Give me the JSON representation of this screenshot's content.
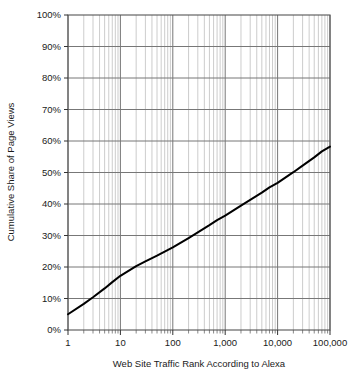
{
  "chart_data": {
    "type": "line",
    "title": "",
    "xlabel": "Web Site Traffic Rank According to Alexa",
    "ylabel": "Cumulative Share of Page Views",
    "xscale": "log",
    "yscale": "linear",
    "xlim": [
      1,
      100000
    ],
    "ylim": [
      0,
      100
    ],
    "grid": true,
    "grid_minor_x": true,
    "legend": "none",
    "x_tick_labels": [
      "1",
      "10",
      "100",
      "1,000",
      "10,000",
      "100,000"
    ],
    "x_tick_values": [
      1,
      10,
      100,
      1000,
      10000,
      100000
    ],
    "y_tick_labels": [
      "0%",
      "10%",
      "20%",
      "30%",
      "40%",
      "50%",
      "60%",
      "70%",
      "80%",
      "90%",
      "100%"
    ],
    "y_tick_values": [
      0,
      10,
      20,
      30,
      40,
      50,
      60,
      70,
      80,
      90,
      100
    ],
    "series": [
      {
        "name": "Cumulative share of page views",
        "color": "#000000",
        "x": [
          1,
          2,
          3,
          5,
          7,
          10,
          20,
          30,
          50,
          70,
          100,
          200,
          300,
          500,
          700,
          1000,
          2000,
          3000,
          5000,
          7000,
          10000,
          20000,
          30000,
          50000,
          70000,
          100000
        ],
        "values": [
          5.0,
          8.3,
          10.4,
          13.2,
          15.2,
          17.2,
          20.3,
          21.8,
          23.6,
          24.9,
          26.2,
          29.2,
          31.0,
          33.3,
          34.9,
          36.3,
          39.5,
          41.3,
          43.6,
          45.3,
          46.7,
          50.1,
          52.2,
          54.8,
          56.7,
          58.2
        ]
      }
    ],
    "annotations": []
  },
  "axes": {
    "y_title": "Cumulative Share of Page Views",
    "x_title": "Web Site Traffic Rank According to Alexa"
  },
  "caption": {
    "partial_text": ""
  }
}
